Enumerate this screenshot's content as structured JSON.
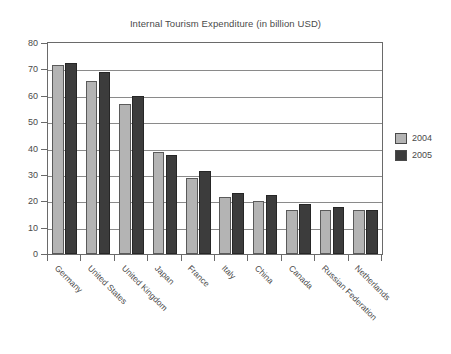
{
  "chart_data": {
    "type": "bar",
    "title": "Internal Tourism Expenditure (in billion USD)",
    "xlabel": "",
    "ylabel": "",
    "ylim": [
      0,
      80
    ],
    "ytick_step": 10,
    "yticks": [
      "80",
      "70",
      "60",
      "50",
      "40",
      "30",
      "20",
      "10",
      "0"
    ],
    "grid": true,
    "legend_position": "right",
    "categories": [
      "Germany",
      "United States",
      "United Kingdom",
      "Japan",
      "France",
      "Italy",
      "China",
      "Canada",
      "Russian Federation",
      "Netherlands"
    ],
    "series": [
      {
        "name": "2004",
        "color": "#b4b4b4",
        "values": [
          71.5,
          65.5,
          57,
          38.5,
          29,
          21.5,
          20,
          16.5,
          16.5,
          16.5
        ]
      },
      {
        "name": "2005",
        "color": "#3c3c3c",
        "values": [
          72.5,
          69,
          60,
          37.5,
          31.5,
          23,
          22.5,
          19,
          18,
          16.5
        ]
      }
    ]
  },
  "legend": {
    "entries": [
      {
        "label": "2004",
        "swatch": "light-gray-swatch"
      },
      {
        "label": "2005",
        "swatch": "dark-gray-swatch"
      }
    ]
  },
  "colors": {
    "series_2004": "#b4b4b4",
    "series_2005": "#3c3c3c",
    "axis": "#6a6a6a",
    "gridline": "#8a8a8a",
    "text": "#4a4a4a",
    "background": "#ffffff"
  }
}
